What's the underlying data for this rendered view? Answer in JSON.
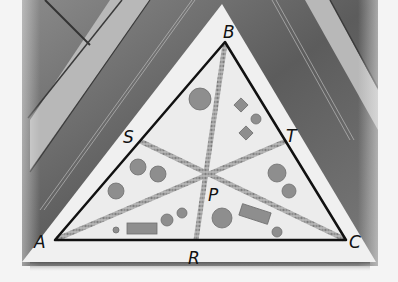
{
  "figure": {
    "vertices": [
      {
        "name": "A",
        "label": "A",
        "x": 55,
        "y": 240,
        "lx": 34,
        "ly": 248
      },
      {
        "name": "B",
        "label": "B",
        "x": 225,
        "y": 42,
        "lx": 223,
        "ly": 38
      },
      {
        "name": "C",
        "label": "C",
        "x": 346,
        "y": 240,
        "lx": 349,
        "ly": 248
      }
    ],
    "midpoints": [
      {
        "name": "R",
        "label": "R",
        "x": 196,
        "y": 240,
        "lx": 188,
        "ly": 264
      },
      {
        "name": "S",
        "label": "S",
        "x": 140,
        "y": 141,
        "lx": 123,
        "ly": 143
      },
      {
        "name": "T",
        "label": "T",
        "x": 286,
        "y": 141,
        "lx": 286,
        "ly": 142
      }
    ],
    "centroid": {
      "name": "P",
      "label": "P",
      "x": 205,
      "y": 173,
      "lx": 208,
      "ly": 201
    },
    "colors": {
      "background": "#f4f4f4",
      "ground_dark": "#6e6e6e",
      "ground_mid": "#9a9a9a",
      "lawn": "#ececec",
      "edge": "#111111",
      "path": "#9c9c9c",
      "tree": "#8a8a8a",
      "bed": "#8c8c8c"
    }
  }
}
